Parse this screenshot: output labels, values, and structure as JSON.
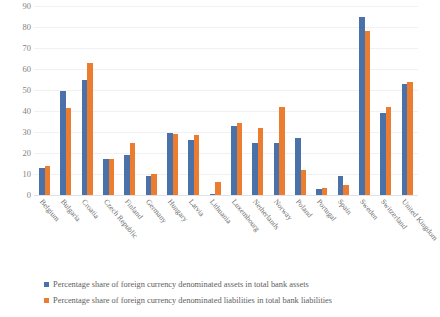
{
  "chart_data": {
    "type": "bar",
    "title": "",
    "subtitle": "",
    "xlabel": "",
    "ylabel": "",
    "ylim": [
      0,
      90
    ],
    "ytick_step": 10,
    "yticks": [
      90,
      80,
      70,
      60,
      50,
      40,
      30,
      20,
      10,
      0
    ],
    "grid": true,
    "legend_position": "bottom-left",
    "categories": [
      "Belgium",
      "Bulgaria",
      "Croatia",
      "Czech Republic",
      "Finland",
      "Germany",
      "Hungary",
      "Latvia",
      "Lithuania",
      "Luxembourg",
      "Netherlands",
      "Norway",
      "Poland",
      "Portugal",
      "Spain",
      "Sweden",
      "Switzerland",
      "United Kingdom"
    ],
    "series": [
      {
        "name": "Percentage share of foreign currency denominated assets in total bank assets",
        "color": "#4a72a8",
        "values": [
          13,
          49.5,
          55,
          17,
          19,
          9,
          29.5,
          26,
          0.5,
          33,
          25,
          25,
          27,
          3,
          9,
          85,
          39,
          53
        ]
      },
      {
        "name": "Percentage share of foreign currency denominated liabilities in total bank liabilities",
        "color": "#ec7c30",
        "values": [
          14,
          41.5,
          63,
          17,
          25,
          10,
          29,
          28.5,
          6,
          34.5,
          32,
          42,
          12,
          3.5,
          5,
          78,
          42,
          54
        ]
      }
    ]
  },
  "legend": {
    "items": [
      {
        "label": "Percentage share of foreign currency denominated assets in total bank assets",
        "color": "#4a72a8"
      },
      {
        "label": "Percentage share of foreign currency denominated liabilities in total bank liabilities",
        "color": "#ec7c30"
      }
    ]
  }
}
